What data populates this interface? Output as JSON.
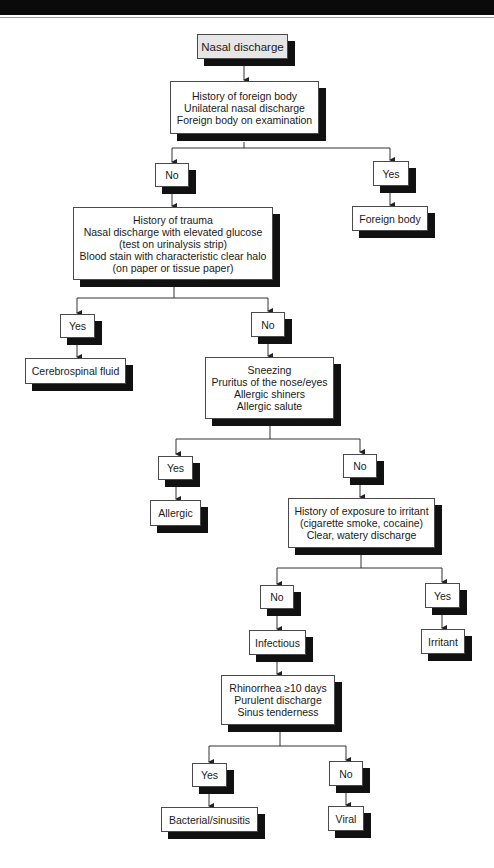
{
  "header": {
    "visible_text": ""
  },
  "flowchart": {
    "title_node": {
      "label": "Nasal discharge"
    },
    "q1": {
      "lines": [
        "History of foreign body",
        "Unilateral nasal discharge",
        "Foreign body on examination"
      ]
    },
    "q1_no": "No",
    "q1_yes": "Yes",
    "q1_yes_result": "Foreign body",
    "q2": {
      "lines": [
        "History of trauma",
        "Nasal discharge with elevated glucose",
        "(test on urinalysis strip)",
        "Blood stain with characteristic clear halo",
        "(on paper or tissue paper)"
      ]
    },
    "q2_yes": "Yes",
    "q2_yes_result": "Cerebrospinal fluid",
    "q2_no": "No",
    "q3": {
      "lines": [
        "Sneezing",
        "Pruritus of the nose/eyes",
        "Allergic shiners",
        "Allergic salute"
      ]
    },
    "q3_yes": "Yes",
    "q3_yes_result": "Allergic",
    "q3_no": "No",
    "q4": {
      "lines": [
        "History of exposure to irritant",
        "(cigarette smoke, cocaine)",
        "Clear, watery discharge"
      ]
    },
    "q4_no": "No",
    "q4_no_result": "Infectious",
    "q4_yes": "Yes",
    "q4_yes_result": "Irritant",
    "q5": {
      "lines": [
        "Rhinorrhea ≥10 days",
        "Purulent discharge",
        "Sinus tenderness"
      ]
    },
    "q5_yes": "Yes",
    "q5_yes_result": "Bacterial/sinusitis",
    "q5_no": "No",
    "q5_no_result": "Viral"
  },
  "colors": {
    "shadow": "#111111",
    "border": "#4a4a4a",
    "start_fill": "#e6e6e6",
    "line": "#333333"
  }
}
